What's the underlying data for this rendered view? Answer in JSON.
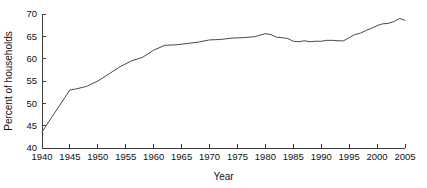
{
  "chart_data": {
    "type": "line",
    "title": "",
    "subtitle": "",
    "xlabel": "Year",
    "ylabel": "Percent of households",
    "xlim": [
      1940,
      2005
    ],
    "ylim": [
      40,
      70
    ],
    "xticks": [
      1940,
      1945,
      1950,
      1955,
      1960,
      1965,
      1970,
      1975,
      1980,
      1985,
      1990,
      1995,
      2000,
      2005
    ],
    "yticks": [
      40,
      45,
      50,
      55,
      60,
      65,
      70
    ],
    "xtick_labels": [
      "1940",
      "1945",
      "1950",
      "1955",
      "1960",
      "1965",
      "1970",
      "1975",
      "1980",
      "1985",
      "1990",
      "1995",
      "2000",
      "2005"
    ],
    "ytick_labels": [
      "40",
      "45",
      "50",
      "55",
      "60",
      "65",
      "70"
    ],
    "grid": false,
    "legend": false,
    "legend_position": "none",
    "line_color": "#4a4a4a",
    "axis_color": "#3a3a3a",
    "background_color": "#ffffff",
    "series": [
      {
        "name": "Percent of households",
        "x": [
          1940,
          1945,
          1946,
          1948,
          1950,
          1952,
          1954,
          1956,
          1958,
          1960,
          1962,
          1964,
          1966,
          1968,
          1970,
          1972,
          1974,
          1976,
          1978,
          1980,
          1981,
          1982,
          1983,
          1984,
          1985,
          1986,
          1987,
          1988,
          1989,
          1990,
          1991,
          1992,
          1993,
          1994,
          1995,
          1996,
          1997,
          1998,
          1999,
          2000,
          2001,
          2002,
          2003,
          2004,
          2005
        ],
        "values": [
          43.6,
          53.0,
          53.2,
          53.8,
          55.0,
          56.6,
          58.2,
          59.5,
          60.3,
          61.9,
          63.0,
          63.1,
          63.4,
          63.7,
          64.2,
          64.3,
          64.6,
          64.7,
          64.9,
          65.6,
          65.4,
          64.8,
          64.7,
          64.5,
          63.9,
          63.8,
          64.0,
          63.8,
          63.9,
          63.9,
          64.1,
          64.1,
          64.0,
          64.0,
          64.7,
          65.4,
          65.7,
          66.3,
          66.8,
          67.4,
          67.8,
          67.9,
          68.3,
          69.0,
          68.6
        ]
      }
    ]
  },
  "plot_geometry": {
    "left": 42,
    "right": 405,
    "top": 14,
    "bottom": 148
  }
}
